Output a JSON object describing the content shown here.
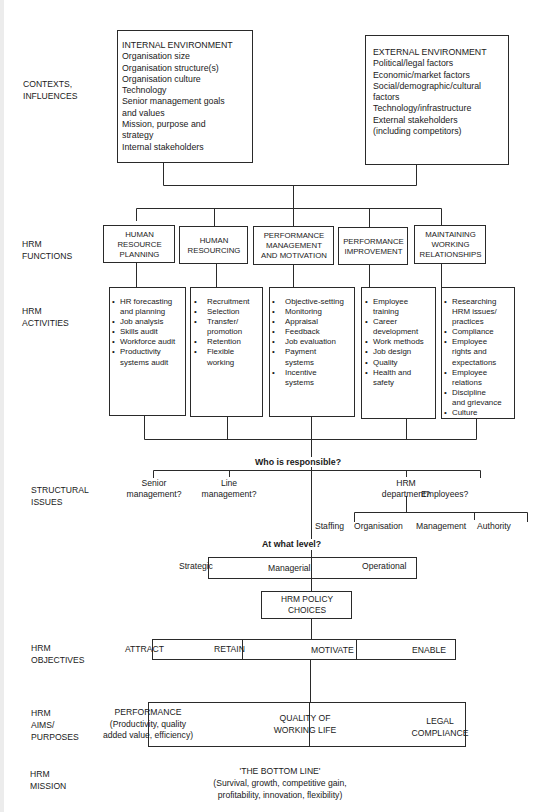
{
  "row_labels": {
    "contexts": "CONTEXTS,\nINFLUENCES",
    "functions": "HRM\nFUNCTIONS",
    "activities": "HRM\nACTIVITIES",
    "structural": "STRUCTURAL\nISSUES",
    "objectives": "HRM\nOBJECTIVES",
    "aims": "HRM\nAIMS/\nPURPOSES",
    "mission": "HRM\nMISSION"
  },
  "internal_environment": {
    "title": "INTERNAL ENVIRONMENT",
    "items": [
      "Organisation size",
      "Organisation structure(s)",
      "Organisation culture",
      "Technology",
      "Senior management goals",
      "and values",
      "Mission, purpose and",
      "strategy",
      "Internal stakeholders"
    ]
  },
  "external_environment": {
    "title": "EXTERNAL ENVIRONMENT",
    "items": [
      "Political/legal factors",
      "Economic/market factors",
      "Social/demographic/cultural",
      "factors",
      "Technology/infrastructure",
      "External stakeholders",
      "(including competitors)"
    ]
  },
  "functions": [
    "HUMAN\nRESOURCE\nPLANNING",
    "HUMAN\nRESOURCING",
    "PERFORMANCE\nMANAGEMENT\nAND MOTIVATION",
    "PERFORMANCE\nIMPROVEMENT",
    "MAINTAINING\nWORKING\nRELATIONSHIPS"
  ],
  "activities": [
    [
      "HR forecasting\nand planning",
      "Job analysis",
      "Skills audit",
      "Workforce audit",
      "Productivity\nsystems audit"
    ],
    [
      "Recruitment",
      "Selection",
      "Transfer/\npromotion",
      "Retention",
      "Flexible\nworking"
    ],
    [
      "Objective-setting",
      "Monitoring",
      "Appraisal",
      "Feedback",
      "Job evaluation",
      "Payment\nsystems",
      "Incentive\nsystems"
    ],
    [
      "Employee\ntraining",
      "Career\ndevelopment",
      "Work methods",
      "Job design",
      "Quality",
      "Health and\nsafety"
    ],
    [
      "Researching\nHRM issues/\npractices",
      "Compliance",
      "Employee\nrights and\nexpectations",
      "Employee\nrelations",
      "Discipline\nand grievance",
      "Culture"
    ]
  ],
  "structural": {
    "question": "Who is responsible?",
    "options": [
      "Senior\nmanagement?",
      "Line\nmanagement?",
      "HRM\ndepartment?",
      "Employees?"
    ],
    "hrm_sub": [
      "Staffing",
      "Organisation",
      "Management",
      "Authority"
    ],
    "level_question": "At what level?",
    "levels": [
      "Strategic",
      "Managerial",
      "Operational"
    ]
  },
  "policy_choices": "HRM POLICY\nCHOICES",
  "objectives": [
    "ATTRACT",
    "RETAIN",
    "MOTIVATE",
    "ENABLE"
  ],
  "aims": {
    "performance": "PERFORMANCE\n(Productivity, quality\nadded value, efficiency)",
    "quality": "QUALITY OF\nWORKING LIFE",
    "legal": "LEGAL\nCOMPLIANCE"
  },
  "mission": {
    "title": "'THE BOTTOM LINE'",
    "detail": "(Survival, growth, competitive gain,\nprofitability, innovation, flexibility)"
  }
}
